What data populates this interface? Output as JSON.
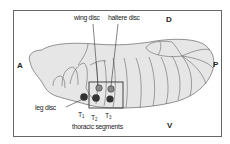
{
  "figure": {
    "orientation": {
      "anterior": "A",
      "posterior": "P",
      "dorsal": "D",
      "ventral": "V"
    },
    "labels": {
      "wing_disc": "wing disc",
      "haltere_disc": "haltere disc",
      "leg_disc": "leg disc",
      "thoracic_segments": "thoracic segments"
    },
    "segments": [
      {
        "name": "T",
        "sub": "1"
      },
      {
        "name": "T",
        "sub": "2"
      },
      {
        "name": "T",
        "sub": "3"
      }
    ],
    "colors": {
      "embryo_fill": "#e6e6e6",
      "outline": "#555555",
      "leg_disc": "#333333",
      "wing_haltere_disc": "#8a8a8a",
      "frame": "#666666"
    }
  }
}
